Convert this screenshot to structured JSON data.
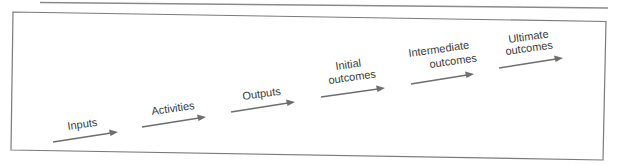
{
  "diagram": {
    "type": "logic-model-flow",
    "colors": {
      "line": "#6e6e6e",
      "frame": "#7a7a7a",
      "text": "#3a3a3a",
      "background": "#ffffff"
    },
    "stages": [
      {
        "id": "inputs",
        "lines": [
          "Inputs"
        ]
      },
      {
        "id": "activities",
        "lines": [
          "Activities"
        ]
      },
      {
        "id": "outputs",
        "lines": [
          "Outputs"
        ]
      },
      {
        "id": "initial-outcomes",
        "lines": [
          "Initial",
          "outcomes"
        ]
      },
      {
        "id": "intermediate-outcomes",
        "lines": [
          "Intermediate",
          "outcomes"
        ]
      },
      {
        "id": "ultimate-outcomes",
        "lines": [
          "Ultimate",
          "outcomes"
        ]
      }
    ]
  }
}
